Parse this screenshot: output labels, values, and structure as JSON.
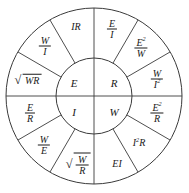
{
  "diagram": {
    "type": "ohms-law-wheel",
    "colors": {
      "background": "#ffffff",
      "line": "#3a3a3a",
      "text": "#1a1a1a"
    },
    "geometry": {
      "center_x": 94,
      "center_y": 96,
      "outer_radius": 88,
      "inner_radius": 38,
      "sector_count": 12,
      "quadrant_count": 4
    },
    "inner_quadrants": [
      {
        "key": "voltage",
        "label": "E",
        "position": "top-left"
      },
      {
        "key": "resistance",
        "label": "R",
        "position": "top-right"
      },
      {
        "key": "current",
        "label": "I",
        "position": "bottom-left"
      },
      {
        "key": "power",
        "label": "W",
        "position": "bottom-right"
      }
    ],
    "outer_sectors": [
      {
        "key": "e-eq-ir",
        "quadrant": "top-left",
        "form": "product",
        "text": "IR",
        "terms": [
          "I",
          "R"
        ]
      },
      {
        "key": "e-eq-w-over-i",
        "quadrant": "top-left",
        "form": "fraction",
        "numerator": "W",
        "denominator": "I"
      },
      {
        "key": "e-eq-sqrt-wr",
        "quadrant": "top-left",
        "form": "radical",
        "radicand": "WR"
      },
      {
        "key": "r-eq-e-over-i",
        "quadrant": "top-right",
        "form": "fraction",
        "numerator": "E",
        "denominator": "I"
      },
      {
        "key": "r-eq-e2-over-w",
        "quadrant": "top-right",
        "form": "fraction",
        "numerator": "E",
        "numerator_exponent": "2",
        "denominator": "W"
      },
      {
        "key": "r-eq-w-over-i2",
        "quadrant": "top-right",
        "form": "fraction",
        "numerator": "W",
        "denominator": "I",
        "denominator_exponent": "2"
      },
      {
        "key": "i-eq-e-over-r",
        "quadrant": "bottom-left",
        "form": "fraction",
        "numerator": "E",
        "denominator": "R"
      },
      {
        "key": "i-eq-w-over-e",
        "quadrant": "bottom-left",
        "form": "fraction",
        "numerator": "W",
        "denominator": "E"
      },
      {
        "key": "i-eq-sqrt-w-over-r",
        "quadrant": "bottom-left",
        "form": "radical-fraction",
        "numerator": "W",
        "denominator": "R"
      },
      {
        "key": "w-eq-ei",
        "quadrant": "bottom-right",
        "form": "product",
        "text": "EI",
        "terms": [
          "E",
          "I"
        ]
      },
      {
        "key": "w-eq-i2r",
        "quadrant": "bottom-right",
        "form": "product-exponent",
        "base": "I",
        "exponent": "2",
        "factor": "R"
      },
      {
        "key": "w-eq-e2-over-r",
        "quadrant": "bottom-right",
        "form": "fraction",
        "numerator": "E",
        "numerator_exponent": "2",
        "denominator": "R"
      }
    ],
    "symbols": {
      "radical_sign": "√"
    }
  }
}
